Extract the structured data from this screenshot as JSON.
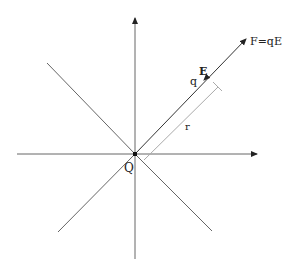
{
  "diagram": {
    "labels": {
      "force": "F=qE",
      "field": "E",
      "test_charge": "q",
      "distance": "r",
      "source_charge": "Q"
    },
    "colors": {
      "line": "#555555",
      "arrow": "#222222",
      "measure": "#aaaaaa",
      "text": "#222222"
    }
  }
}
